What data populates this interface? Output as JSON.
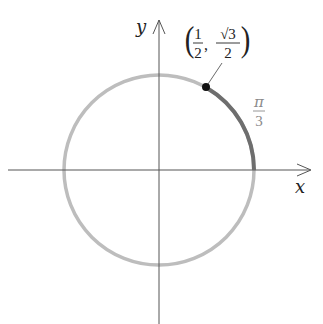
{
  "diagram": {
    "type": "unit-circle",
    "axes": {
      "x_label": "x",
      "y_label": "y"
    },
    "circle": {
      "center_px": [
        159,
        170
      ],
      "radius_px": 95,
      "color": "#b8b8b8"
    },
    "arc": {
      "from_angle": "0",
      "to_angle": "π/3",
      "color": "#6e6e6e"
    },
    "point": {
      "label_open": "(",
      "label_close": ")",
      "x_num": "1",
      "x_den": "2",
      "comma": ",",
      "y_num": "√3",
      "y_den": "2",
      "color": "#111111"
    },
    "angle_label": {
      "num": "π",
      "den": "3",
      "color": "#8a8a8a"
    }
  }
}
